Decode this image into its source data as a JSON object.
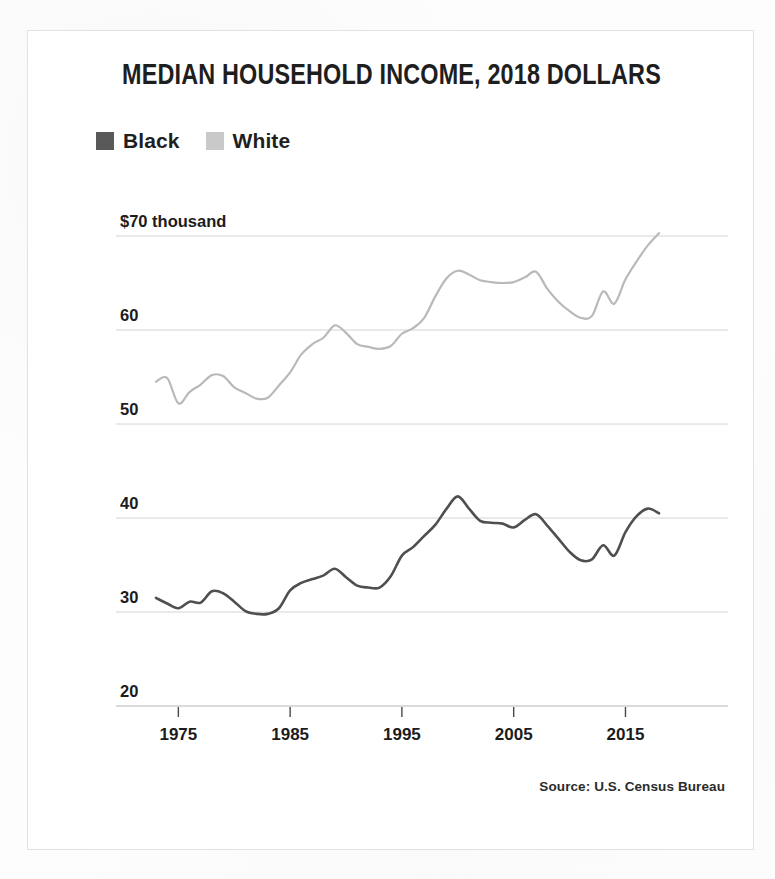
{
  "figure": {
    "title": "MEDIAN HOUSEHOLD INCOME, 2018 DOLLARS",
    "source": "Source: U.S. Census Bureau",
    "border_color": "#e2e2e2",
    "background": "#ffffff"
  },
  "legend": {
    "items": [
      {
        "label": "Black",
        "color": "#595959"
      },
      {
        "label": "White",
        "color": "#c9c9c9"
      }
    ]
  },
  "chart_data": {
    "type": "line",
    "title": "MEDIAN HOUSEHOLD INCOME, 2018 DOLLARS",
    "subtitle": "",
    "xlabel": "",
    "ylabel": "",
    "units": "thousands of 2018 dollars",
    "grid": true,
    "legend_position": "top-left",
    "xlim": [
      1972,
      2019
    ],
    "ylim": [
      20,
      70
    ],
    "xticks": [
      1975,
      1985,
      1995,
      2005,
      2015
    ],
    "xtick_labels": [
      "1975",
      "1985",
      "1995",
      "2005",
      "2015"
    ],
    "yticks": [
      70,
      60,
      50,
      40,
      30,
      20
    ],
    "ytick_labels": [
      "$70 thousand",
      "60",
      "50",
      "40",
      "30",
      "20"
    ],
    "x": [
      1973,
      1974,
      1975,
      1976,
      1977,
      1978,
      1979,
      1980,
      1981,
      1982,
      1983,
      1984,
      1985,
      1986,
      1987,
      1988,
      1989,
      1990,
      1991,
      1992,
      1993,
      1994,
      1995,
      1996,
      1997,
      1998,
      1999,
      2000,
      2001,
      2002,
      2003,
      2004,
      2005,
      2006,
      2007,
      2008,
      2009,
      2010,
      2011,
      2012,
      2013,
      2014,
      2015,
      2016,
      2017,
      2018
    ],
    "series": [
      {
        "name": "Black",
        "color": "#4f4f4f",
        "line_width": 2.6,
        "values": [
          31.5,
          30.9,
          30.4,
          31.1,
          31.0,
          32.2,
          32.0,
          31.1,
          30.1,
          29.8,
          29.8,
          30.4,
          32.3,
          33.1,
          33.5,
          33.9,
          34.6,
          33.7,
          32.8,
          32.6,
          32.6,
          33.8,
          36.0,
          36.9,
          38.1,
          39.3,
          41.0,
          42.3,
          41.0,
          39.7,
          39.5,
          39.4,
          39.0,
          39.8,
          40.4,
          39.2,
          37.8,
          36.4,
          35.5,
          35.6,
          37.1,
          36.0,
          38.5,
          40.2,
          41.0,
          40.5
        ]
      },
      {
        "name": "White",
        "color": "#b9b9b9",
        "line_width": 2.2,
        "values": [
          54.5,
          54.9,
          52.2,
          53.4,
          54.2,
          55.2,
          55.1,
          53.9,
          53.3,
          52.7,
          52.8,
          54.1,
          55.5,
          57.4,
          58.5,
          59.2,
          60.5,
          59.7,
          58.5,
          58.2,
          58.0,
          58.3,
          59.6,
          60.2,
          61.3,
          63.6,
          65.5,
          66.3,
          65.9,
          65.3,
          65.1,
          65.0,
          65.1,
          65.6,
          66.2,
          64.4,
          63.0,
          62.0,
          61.3,
          61.5,
          64.1,
          62.8,
          65.4,
          67.3,
          69.0,
          70.3
        ]
      }
    ]
  },
  "axes": {
    "grid_color": "#cfcfcf",
    "axis_color": "#b4b4b4",
    "tick_color": "#4a4a4a"
  }
}
